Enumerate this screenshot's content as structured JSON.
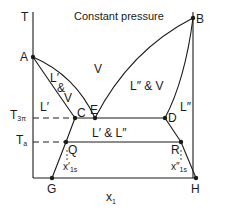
{
  "diagram": {
    "title": "Constant pressure",
    "axes": {
      "y_label": "T",
      "x_label": "x",
      "x_label_sub": "1",
      "y_ticks": [
        {
          "label": "T",
          "sub": "3π",
          "y": 118
        },
        {
          "label": "T",
          "sub": "a",
          "y": 142
        }
      ]
    },
    "points": {
      "A": "A",
      "B": "B",
      "C": "C",
      "D": "D",
      "E": "E",
      "G": "G",
      "H": "H",
      "Q": "Q",
      "R": "R"
    },
    "regions": {
      "vapor": "V",
      "l1_v_L": "L′",
      "l1_v_amp": "&",
      "l1_v_V": "V",
      "l2_v": "L″ & V",
      "l1": "L′",
      "l2": "L″",
      "l1_l2": "L′ & L″"
    },
    "compositions": {
      "x1s_prime": "x′",
      "x1s_prime_sub": "1s",
      "x1s_dprime": "x″",
      "x1s_dprime_sub": "1s"
    },
    "colors": {
      "line": "#1a1a1a",
      "background": "#ffffff"
    }
  }
}
